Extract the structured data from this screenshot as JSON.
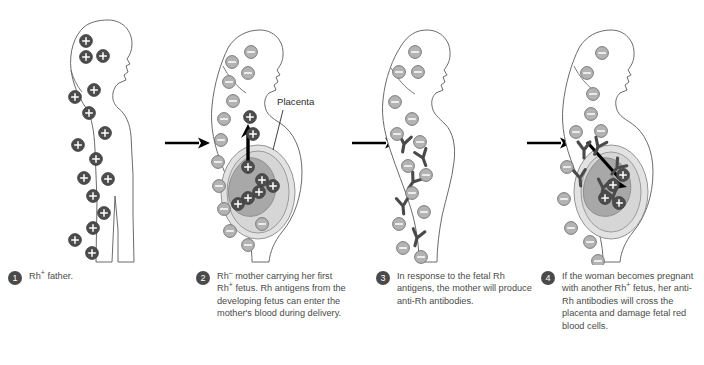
{
  "figure": {
    "background_color": "#ffffff",
    "colors": {
      "rh_positive_cell_fill": "#4d4d4d",
      "rh_negative_cell_fill": "#b3b3b3",
      "cell_stroke": "#555555",
      "body_outline": "#6b6b6b",
      "antibody_color": "#4a4a4a",
      "fetus_fill": "#a8a8a8",
      "womb_fill": "#d9d9d9",
      "arrow_color": "#000000",
      "badge_color": "#4a4a4a",
      "text_color": "#4a4a4a"
    }
  },
  "annotations": {
    "placenta_label": "Placenta"
  },
  "arrows": {
    "between_1_2": "arrow-right",
    "between_2_3": "arrow-right",
    "between_3_4": "arrow-right",
    "antigens_enter_mother": "arrow-up",
    "antibodies_cross_placenta": "arrow-down-right"
  },
  "panels": [
    {
      "number": "1",
      "figure_type": "male",
      "blood_type": "Rh+",
      "caption_parts": [
        {
          "text": "Rh"
        },
        {
          "sup": "+"
        },
        {
          "text": " father."
        }
      ],
      "caption_plain": "Rh+ father.",
      "cells": [
        {
          "x": 86,
          "y": 41,
          "type": "positive"
        },
        {
          "x": 103,
          "y": 56,
          "type": "positive"
        },
        {
          "x": 86,
          "y": 57,
          "type": "positive"
        },
        {
          "x": 94,
          "y": 90,
          "type": "positive"
        },
        {
          "x": 75,
          "y": 97,
          "type": "positive"
        },
        {
          "x": 89,
          "y": 113,
          "type": "positive"
        },
        {
          "x": 105,
          "y": 133,
          "type": "positive"
        },
        {
          "x": 78,
          "y": 145,
          "type": "positive"
        },
        {
          "x": 96,
          "y": 159,
          "type": "positive"
        },
        {
          "x": 84,
          "y": 178,
          "type": "positive"
        },
        {
          "x": 108,
          "y": 179,
          "type": "positive"
        },
        {
          "x": 93,
          "y": 196,
          "type": "positive"
        },
        {
          "x": 104,
          "y": 213,
          "type": "positive"
        },
        {
          "x": 93,
          "y": 228,
          "type": "positive"
        },
        {
          "x": 75,
          "y": 240,
          "type": "positive"
        },
        {
          "x": 92,
          "y": 253,
          "type": "positive"
        }
      ]
    },
    {
      "number": "2",
      "figure_type": "pregnant-female",
      "blood_type": "Rh-",
      "has_fetus": true,
      "caption_parts": [
        {
          "text": "Rh"
        },
        {
          "sup": "–"
        },
        {
          "text": " mother carrying her first Rh"
        },
        {
          "sup": "+"
        },
        {
          "text": " fetus.  Rh antigens from the developing fetus can enter the mother's blood during delivery."
        }
      ],
      "caption_plain": "Rh– mother carrying her first Rh+ fetus.  Rh antigens from the developing fetus can enter the mother's blood during delivery.",
      "cells": [
        {
          "x": 61,
          "y": 52,
          "type": "negative"
        },
        {
          "x": 42,
          "y": 62,
          "type": "negative"
        },
        {
          "x": 58,
          "y": 73,
          "type": "negative"
        },
        {
          "x": 39,
          "y": 82,
          "type": "negative"
        },
        {
          "x": 43,
          "y": 101,
          "type": "negative"
        },
        {
          "x": 34,
          "y": 119,
          "type": "negative"
        },
        {
          "x": 31,
          "y": 140,
          "type": "negative"
        },
        {
          "x": 60,
          "y": 117,
          "type": "positive"
        },
        {
          "x": 63,
          "y": 134,
          "type": "positive"
        },
        {
          "x": 28,
          "y": 162,
          "type": "negative"
        },
        {
          "x": 29,
          "y": 186,
          "type": "negative"
        },
        {
          "x": 34,
          "y": 209,
          "type": "negative"
        },
        {
          "x": 40,
          "y": 231,
          "type": "negative"
        },
        {
          "x": 58,
          "y": 245,
          "type": "negative"
        },
        {
          "x": 72,
          "y": 224,
          "type": "negative"
        }
      ],
      "fetal_cells": [
        {
          "x": 58,
          "y": 167,
          "type": "positive"
        },
        {
          "x": 72,
          "y": 180,
          "type": "positive"
        },
        {
          "x": 83,
          "y": 186,
          "type": "positive"
        },
        {
          "x": 69,
          "y": 192,
          "type": "positive"
        },
        {
          "x": 58,
          "y": 198,
          "type": "positive"
        },
        {
          "x": 48,
          "y": 204,
          "type": "positive"
        }
      ]
    },
    {
      "number": "3",
      "figure_type": "female",
      "blood_type": "Rh-",
      "has_antibodies": true,
      "caption_parts": [
        {
          "text": "In response to the fetal Rh antigens, the mother will produce anti-Rh antibodies."
        }
      ],
      "caption_plain": "In response to the fetal Rh antigens, the mother will produce anti-Rh antibodies.",
      "cells": [
        {
          "x": 60,
          "y": 52,
          "type": "negative"
        },
        {
          "x": 44,
          "y": 72,
          "type": "negative"
        },
        {
          "x": 63,
          "y": 72,
          "type": "negative"
        },
        {
          "x": 40,
          "y": 102,
          "type": "negative"
        },
        {
          "x": 57,
          "y": 119,
          "type": "negative"
        },
        {
          "x": 42,
          "y": 134,
          "type": "negative"
        },
        {
          "x": 65,
          "y": 142,
          "type": "negative"
        },
        {
          "x": 53,
          "y": 166,
          "type": "negative"
        },
        {
          "x": 71,
          "y": 175,
          "type": "negative"
        },
        {
          "x": 57,
          "y": 193,
          "type": "negative"
        },
        {
          "x": 69,
          "y": 212,
          "type": "negative"
        },
        {
          "x": 44,
          "y": 224,
          "type": "negative"
        },
        {
          "x": 48,
          "y": 248,
          "type": "negative"
        },
        {
          "x": 66,
          "y": 257,
          "type": "negative"
        }
      ],
      "antibodies": [
        {
          "x": 49,
          "y": 144,
          "rot": 10
        },
        {
          "x": 68,
          "y": 158,
          "rot": -20
        },
        {
          "x": 58,
          "y": 182,
          "rot": 35
        },
        {
          "x": 48,
          "y": 206,
          "rot": -5
        },
        {
          "x": 62,
          "y": 238,
          "rot": 15
        }
      ]
    },
    {
      "number": "4",
      "figure_type": "pregnant-female",
      "blood_type": "Rh-",
      "has_fetus": true,
      "has_antibodies": true,
      "caption_parts": [
        {
          "text": "If the woman becomes pregnant with another Rh"
        },
        {
          "sup": "+"
        },
        {
          "text": " fetus, her anti-Rh antibodies will cross the placenta and damage fetal red blood cells."
        }
      ],
      "caption_plain": "If the woman becomes pregnant with another Rh+ fetus, her anti-Rh antibodies will cross the placenta and damage fetal red blood cells.",
      "cells": [
        {
          "x": 67,
          "y": 53,
          "type": "negative"
        },
        {
          "x": 52,
          "y": 73,
          "type": "negative"
        },
        {
          "x": 58,
          "y": 94,
          "type": "negative"
        },
        {
          "x": 56,
          "y": 114,
          "type": "negative"
        },
        {
          "x": 41,
          "y": 132,
          "type": "negative"
        },
        {
          "x": 66,
          "y": 131,
          "type": "negative"
        },
        {
          "x": 32,
          "y": 167,
          "type": "negative"
        },
        {
          "x": 29,
          "y": 199,
          "type": "negative"
        },
        {
          "x": 36,
          "y": 228,
          "type": "negative"
        },
        {
          "x": 55,
          "y": 242,
          "type": "negative"
        },
        {
          "x": 63,
          "y": 261,
          "type": "negative"
        }
      ],
      "antibodies": [
        {
          "x": 49,
          "y": 150,
          "rot": 0
        },
        {
          "x": 63,
          "y": 147,
          "rot": 25
        },
        {
          "x": 45,
          "y": 178,
          "rot": -5
        }
      ],
      "fetal_cells": [
        {
          "x": 88,
          "y": 175,
          "type": "positive"
        },
        {
          "x": 78,
          "y": 185,
          "type": "positive"
        },
        {
          "x": 70,
          "y": 198,
          "type": "positive"
        },
        {
          "x": 84,
          "y": 203,
          "type": "positive"
        }
      ],
      "fetal_antibodies": [
        {
          "x": 82,
          "y": 168,
          "rot": 40
        },
        {
          "x": 68,
          "y": 188,
          "rot": 10
        },
        {
          "x": 78,
          "y": 197,
          "rot": -15
        }
      ]
    }
  ]
}
